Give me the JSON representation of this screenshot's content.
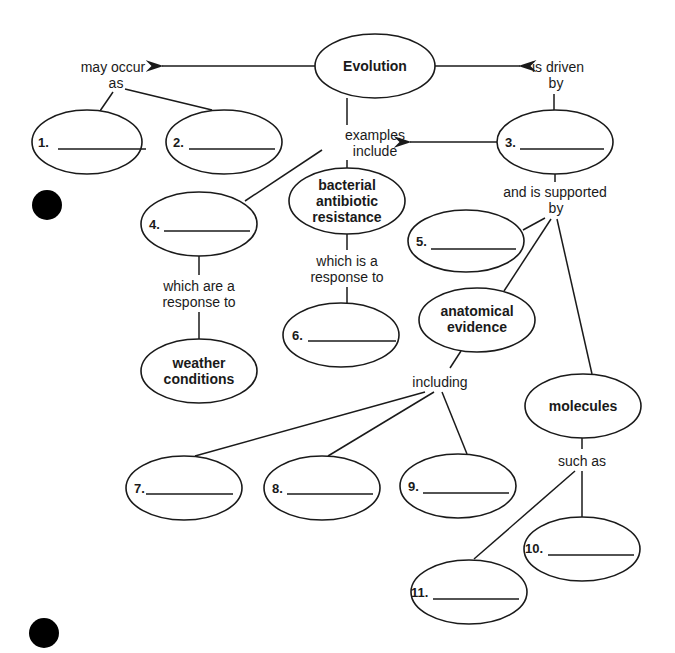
{
  "colors": {
    "ink": "#1a1a1a",
    "background": "#ffffff",
    "binder_hole": "#000000"
  },
  "concept_map": {
    "central": "Evolution",
    "links": {
      "may_occur_as": [
        "may occur",
        "as"
      ],
      "is_driven_by": [
        "is driven",
        "by"
      ],
      "examples_include": [
        "examples",
        "include"
      ],
      "and_is_supported_by": [
        "and is supported",
        "by"
      ],
      "which_are_a_response_to": [
        "which are a",
        "response to"
      ],
      "which_is_a_response_to": [
        "which is a",
        "response to"
      ],
      "including": "including",
      "such_as": "such as"
    },
    "given_concepts": {
      "bacterial": [
        "bacterial",
        "antibiotic",
        "resistance"
      ],
      "weather": [
        "weather",
        "conditions"
      ],
      "anatomical": [
        "anatomical",
        "evidence"
      ],
      "molecules": "molecules"
    },
    "blanks": [
      "1.",
      "2.",
      "3.",
      "4.",
      "5.",
      "6.",
      "7.",
      "8.",
      "9.",
      "10.",
      "11."
    ]
  }
}
